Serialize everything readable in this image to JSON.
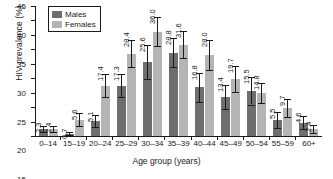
{
  "chart_data": {
    "type": "bar",
    "title": "",
    "xlabel": "Age group (years)",
    "ylabel": "HIV prevalence (%)",
    "ylim": [
      0,
      45
    ],
    "yticks": [
      0,
      5,
      10,
      15,
      20,
      25,
      30,
      35,
      40,
      45
    ],
    "grid": false,
    "legend_position": "top-left",
    "categories": [
      "0–14",
      "15–19",
      "20–24",
      "25–29",
      "30–34",
      "35–39",
      "40–44",
      "45–49",
      "50–54",
      "55–59",
      "60+"
    ],
    "series": [
      {
        "name": "Males",
        "color": "#6e6e6e",
        "values": [
          2.3,
          0.7,
          5.1,
          17.3,
          25.6,
          28.8,
          16.8,
          13.4,
          15.5,
          5.5,
          4.6
        ],
        "err_low": [
          1.0,
          0.5,
          2.0,
          3.8,
          5.8,
          5.0,
          4.9,
          4.0,
          4.6,
          2.6,
          2.2
        ],
        "err_high": [
          1.2,
          0.6,
          2.2,
          4.0,
          6.0,
          5.2,
          5.0,
          4.2,
          5.0,
          2.8,
          2.4
        ]
      },
      {
        "name": "Females",
        "color": "#b4b4b4",
        "values": [
          2.4,
          5.6,
          17.4,
          28.4,
          36.0,
          31.6,
          28.0,
          19.7,
          14.8,
          9.7,
          2.4
        ],
        "err_low": [
          1.1,
          2.0,
          3.8,
          4.6,
          5.0,
          4.6,
          5.2,
          4.3,
          3.4,
          3.0,
          1.3
        ],
        "err_high": [
          1.2,
          2.2,
          4.0,
          4.8,
          5.2,
          4.8,
          5.4,
          4.5,
          3.6,
          3.2,
          1.4
        ]
      }
    ],
    "data_labels": {
      "males": [
        "2.3",
        "0.7",
        "5.1",
        "17.3",
        "25.6",
        "28.8",
        "16.8",
        "13.4",
        "15.5",
        "5.5",
        "4.6"
      ],
      "females": [
        "2.4",
        "5.6",
        "17.4",
        "28.4",
        "36.0",
        "31.6",
        "28.0",
        "19.7",
        "14.8",
        "9.7",
        "2.4"
      ]
    }
  },
  "legend": {
    "items": [
      {
        "label": "Males",
        "key": "m"
      },
      {
        "label": "Females",
        "key": "f"
      }
    ]
  }
}
